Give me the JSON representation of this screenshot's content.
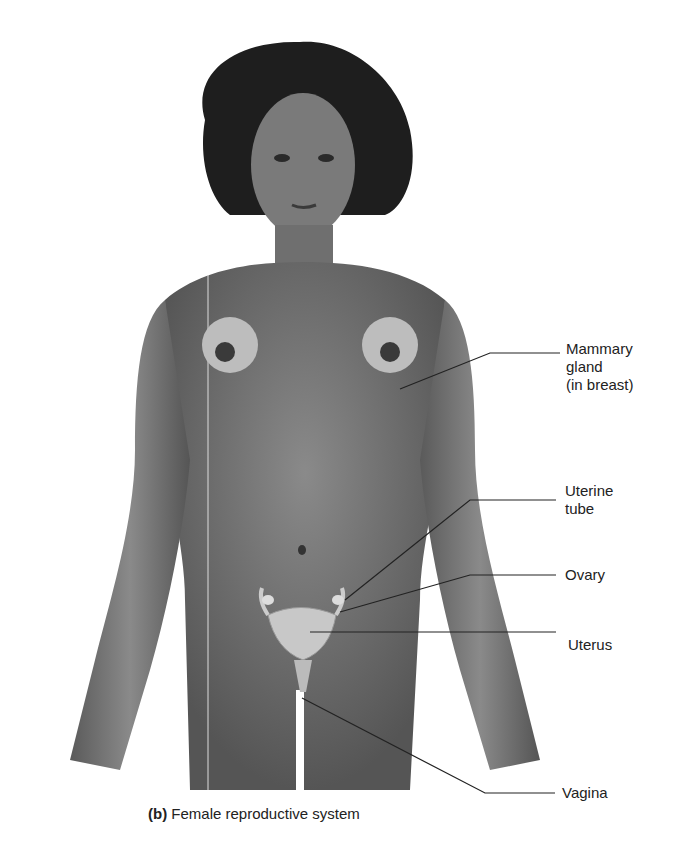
{
  "figure": {
    "caption_prefix": "(b)",
    "caption_text": "Female reproductive system",
    "labels": [
      {
        "id": "mammary",
        "line1": "Mammary",
        "line2": "gland",
        "line3": "(in breast)"
      },
      {
        "id": "uterine-tube",
        "line1": "Uterine",
        "line2": "tube"
      },
      {
        "id": "ovary",
        "line1": "Ovary"
      },
      {
        "id": "uterus",
        "line1": "Uterus"
      },
      {
        "id": "vagina",
        "line1": "Vagina"
      }
    ]
  }
}
